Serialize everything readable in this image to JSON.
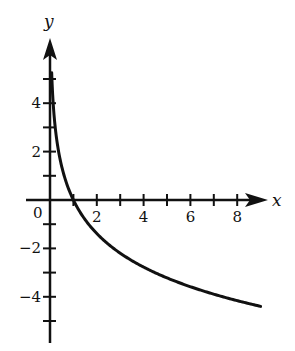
{
  "chart_data": {
    "type": "line",
    "title": "",
    "xlabel": "x",
    "ylabel": "y",
    "xlim": [
      -1,
      9.3
    ],
    "ylim": [
      -6,
      6.5
    ],
    "x_ticks": [
      1,
      2,
      3,
      4,
      5,
      6,
      7,
      8
    ],
    "x_tick_labels": [
      "2",
      "4",
      "6",
      "8"
    ],
    "y_ticks": [
      -5,
      -4,
      -3,
      -2,
      -1,
      1,
      2,
      3,
      4,
      5
    ],
    "y_tick_labels": [
      "4",
      "2",
      "-2",
      "-4"
    ],
    "origin_label": "0",
    "grid": false,
    "legend": null,
    "series": [
      {
        "name": "y = -2 ln x",
        "x": [
          0.07,
          0.1,
          0.2,
          0.3,
          0.5,
          0.75,
          1,
          1.5,
          2,
          3,
          4,
          5,
          6,
          7,
          8,
          9
        ],
        "y": [
          5.3,
          4.6,
          3.2,
          2.4,
          1.4,
          0.6,
          0,
          -0.8,
          -1.4,
          -2.2,
          -2.8,
          -3.2,
          -3.6,
          -3.9,
          -4.2,
          -4.4
        ]
      }
    ]
  },
  "layout": {
    "origin_px": [
      50,
      200
    ],
    "unit_x_px": 23.4,
    "unit_y_px": 24.2,
    "line_color": "#111111"
  }
}
